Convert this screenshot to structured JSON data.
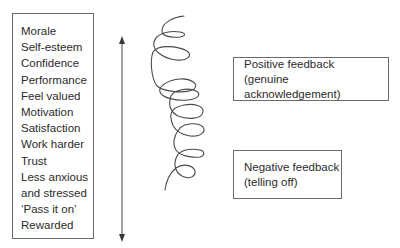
{
  "outcomes": {
    "items": [
      "Morale",
      "Self-esteem",
      "Confidence",
      "Performance",
      "Feel valued",
      "Motivation",
      "Satisfaction",
      "Work harder",
      "Trust",
      "Less anxious",
      "and stressed",
      "‘Pass it on’",
      "Rewarded"
    ]
  },
  "positive_feedback": {
    "title": "Positive feedback",
    "subtitle": "(genuine acknowledgement)"
  },
  "negative_feedback": {
    "title": "Negative feedback",
    "subtitle": "(telling off)"
  },
  "arrow": {
    "direction": "bidirectional-vertical",
    "color": "#6a6a6a"
  },
  "spiral": {
    "color": "#4a4a4a"
  }
}
